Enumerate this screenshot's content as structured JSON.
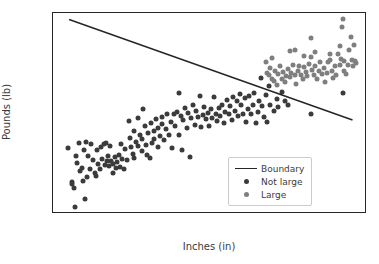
{
  "chart_data": {
    "type": "scatter",
    "title": "",
    "xlabel": "Inches (in)",
    "ylabel": "Pounds (lb)",
    "xlim": [
      59.0,
      78.5
    ],
    "ylim": [
      85,
      209
    ],
    "xticks": [
      "60.0",
      "62.5",
      "65.0",
      "67.5",
      "70.0",
      "72.5",
      "75.0",
      "77.5"
    ],
    "xtick_values": [
      60.0,
      62.5,
      65.0,
      67.5,
      70.0,
      72.5,
      75.0,
      77.5
    ],
    "yticks": [
      "100",
      "120",
      "140",
      "160",
      "180",
      "200"
    ],
    "ytick_values": [
      100,
      120,
      140,
      160,
      180,
      200
    ],
    "grid": false,
    "legend_position": "lower right",
    "legend": [
      {
        "label": "Boundary",
        "marker": "line",
        "color": "#262626"
      },
      {
        "label": "Not large",
        "marker": "dot",
        "color": "#3b3b3b"
      },
      {
        "label": "Large",
        "marker": "dot",
        "color": "#7f7f7f"
      }
    ],
    "annotations": [
      {
        "name": "boundary-line",
        "type": "line",
        "x": [
          60.0,
          77.6
        ],
        "y": [
          205.0,
          143.0
        ],
        "color": "#262626"
      }
    ],
    "series": [
      {
        "name": "Not large",
        "color": "#3b3b3b",
        "points": [
          [
            59.95,
            126.0
          ],
          [
            60.15,
            105.0
          ],
          [
            60.2,
            103.5
          ],
          [
            60.3,
            101.0
          ],
          [
            60.35,
            89.5
          ],
          [
            60.4,
            120.5
          ],
          [
            60.5,
            116.5
          ],
          [
            60.6,
            129.0
          ],
          [
            60.7,
            111.5
          ],
          [
            60.8,
            113.5
          ],
          [
            60.85,
            105.5
          ],
          [
            60.9,
            124.5
          ],
          [
            61.0,
            94.0
          ],
          [
            61.05,
            129.5
          ],
          [
            61.1,
            108.0
          ],
          [
            61.2,
            121.0
          ],
          [
            61.3,
            113.0
          ],
          [
            61.35,
            128.0
          ],
          [
            61.5,
            118.5
          ],
          [
            61.6,
            110.5
          ],
          [
            61.7,
            108.5
          ],
          [
            61.75,
            124.5
          ],
          [
            61.8,
            116.0
          ],
          [
            61.9,
            113.0
          ],
          [
            62.0,
            126.5
          ],
          [
            62.05,
            119.0
          ],
          [
            62.15,
            128.0
          ],
          [
            62.2,
            115.5
          ],
          [
            62.3,
            128.5
          ],
          [
            62.35,
            117.5
          ],
          [
            62.4,
            121.0
          ],
          [
            62.5,
            114.5
          ],
          [
            62.55,
            127.0
          ],
          [
            62.6,
            118.0
          ],
          [
            62.7,
            110.5
          ],
          [
            62.75,
            116.0
          ],
          [
            62.85,
            120.0
          ],
          [
            62.9,
            113.5
          ],
          [
            63.0,
            117.0
          ],
          [
            63.1,
            121.5
          ],
          [
            63.15,
            114.0
          ],
          [
            63.25,
            128.0
          ],
          [
            63.3,
            119.0
          ],
          [
            63.4,
            112.5
          ],
          [
            63.5,
            125.0
          ],
          [
            63.6,
            118.5
          ],
          [
            63.7,
            142.5
          ],
          [
            63.8,
            132.0
          ],
          [
            63.85,
            126.5
          ],
          [
            63.95,
            122.0
          ],
          [
            64.0,
            136.0
          ],
          [
            64.05,
            119.5
          ],
          [
            64.15,
            129.5
          ],
          [
            64.25,
            144.5
          ],
          [
            64.3,
            127.0
          ],
          [
            64.4,
            133.5
          ],
          [
            64.5,
            124.0
          ],
          [
            64.55,
            131.0
          ],
          [
            64.6,
            149.5
          ],
          [
            64.7,
            139.0
          ],
          [
            64.75,
            127.5
          ],
          [
            64.85,
            121.5
          ],
          [
            64.9,
            135.0
          ],
          [
            65.0,
            119.5
          ],
          [
            65.1,
            141.0
          ],
          [
            65.15,
            128.5
          ],
          [
            65.25,
            136.5
          ],
          [
            65.3,
            131.0
          ],
          [
            65.4,
            143.5
          ],
          [
            65.5,
            126.5
          ],
          [
            65.55,
            138.0
          ],
          [
            65.65,
            133.0
          ],
          [
            65.75,
            145.0
          ],
          [
            65.8,
            140.5
          ],
          [
            65.9,
            130.5
          ],
          [
            66.0,
            137.5
          ],
          [
            66.1,
            147.0
          ],
          [
            66.2,
            134.0
          ],
          [
            66.3,
            142.0
          ],
          [
            66.4,
            126.0
          ],
          [
            66.5,
            146.5
          ],
          [
            66.6,
            139.5
          ],
          [
            66.7,
            148.0
          ],
          [
            66.8,
            159.5
          ],
          [
            66.85,
            134.0
          ],
          [
            66.95,
            145.5
          ],
          [
            67.0,
            124.5
          ],
          [
            67.1,
            143.0
          ],
          [
            67.2,
            150.5
          ],
          [
            67.3,
            138.0
          ],
          [
            67.4,
            147.5
          ],
          [
            67.5,
            120.0
          ],
          [
            67.6,
            144.0
          ],
          [
            67.7,
            152.0
          ],
          [
            67.8,
            140.0
          ],
          [
            67.9,
            148.5
          ],
          [
            68.0,
            145.0
          ],
          [
            68.1,
            157.5
          ],
          [
            68.2,
            138.5
          ],
          [
            68.3,
            146.0
          ],
          [
            68.4,
            151.0
          ],
          [
            68.5,
            143.5
          ],
          [
            68.6,
            147.5
          ],
          [
            68.7,
            139.0
          ],
          [
            68.8,
            149.5
          ],
          [
            68.9,
            144.0
          ],
          [
            69.0,
            157.0
          ],
          [
            69.1,
            147.0
          ],
          [
            69.2,
            142.5
          ],
          [
            69.3,
            150.5
          ],
          [
            69.4,
            145.5
          ],
          [
            69.5,
            152.0
          ],
          [
            69.6,
            141.0
          ],
          [
            69.7,
            148.0
          ],
          [
            69.8,
            155.5
          ],
          [
            69.9,
            146.5
          ],
          [
            70.0,
            151.5
          ],
          [
            70.1,
            143.0
          ],
          [
            70.2,
            157.0
          ],
          [
            70.3,
            148.5
          ],
          [
            70.4,
            155.0
          ],
          [
            70.5,
            145.5
          ],
          [
            70.6,
            159.0
          ],
          [
            70.7,
            152.5
          ],
          [
            70.8,
            147.0
          ],
          [
            70.9,
            156.5
          ],
          [
            71.0,
            142.0
          ],
          [
            71.1,
            150.0
          ],
          [
            71.2,
            157.5
          ],
          [
            71.3,
            146.5
          ],
          [
            71.4,
            152.5
          ],
          [
            71.5,
            159.5
          ],
          [
            71.6,
            141.0
          ],
          [
            71.7,
            148.0
          ],
          [
            71.8,
            155.0
          ],
          [
            71.9,
            169.0
          ],
          [
            72.0,
            151.5
          ],
          [
            72.1,
            145.0
          ],
          [
            72.2,
            158.5
          ],
          [
            72.3,
            142.0
          ],
          [
            72.4,
            164.0
          ],
          [
            72.5,
            152.0
          ],
          [
            72.7,
            148.5
          ],
          [
            72.9,
            156.0
          ],
          [
            73.0,
            151.0
          ],
          [
            73.2,
            160.5
          ],
          [
            73.4,
            154.5
          ],
          [
            73.6,
            152.0
          ],
          [
            75.0,
            147.0
          ],
          [
            77.0,
            159.5
          ]
        ]
      },
      {
        "name": "Large",
        "color": "#7f7f7f",
        "points": [
          [
            72.2,
            178.5
          ],
          [
            72.3,
            172.0
          ],
          [
            72.4,
            170.5
          ],
          [
            72.5,
            175.0
          ],
          [
            72.6,
            168.5
          ],
          [
            72.7,
            167.0
          ],
          [
            72.8,
            173.5
          ],
          [
            72.9,
            164.5
          ],
          [
            73.0,
            171.5
          ],
          [
            73.1,
            176.0
          ],
          [
            73.2,
            168.0
          ],
          [
            73.3,
            172.5
          ],
          [
            73.4,
            166.5
          ],
          [
            73.5,
            170.0
          ],
          [
            73.6,
            174.5
          ],
          [
            73.7,
            169.5
          ],
          [
            73.8,
            172.0
          ],
          [
            73.9,
            177.0
          ],
          [
            74.0,
            170.5
          ],
          [
            74.1,
            165.5
          ],
          [
            74.2,
            173.0
          ],
          [
            74.3,
            176.5
          ],
          [
            74.4,
            171.0
          ],
          [
            74.5,
            168.0
          ],
          [
            74.6,
            175.5
          ],
          [
            74.7,
            172.5
          ],
          [
            74.8,
            170.0
          ],
          [
            74.9,
            177.5
          ],
          [
            75.0,
            193.5
          ],
          [
            75.0,
            182.0
          ],
          [
            75.1,
            174.0
          ],
          [
            75.2,
            171.0
          ],
          [
            75.3,
            176.0
          ],
          [
            75.4,
            168.5
          ],
          [
            75.5,
            173.5
          ],
          [
            75.6,
            179.0
          ],
          [
            75.7,
            171.5
          ],
          [
            75.8,
            175.0
          ],
          [
            75.9,
            166.5
          ],
          [
            76.0,
            172.0
          ],
          [
            76.1,
            178.5
          ],
          [
            76.2,
            180.0
          ],
          [
            76.3,
            173.0
          ],
          [
            76.4,
            169.0
          ],
          [
            76.5,
            176.5
          ],
          [
            76.6,
            171.0
          ],
          [
            76.7,
            183.5
          ],
          [
            76.8,
            177.0
          ],
          [
            76.85,
            188.5
          ],
          [
            76.9,
            180.5
          ],
          [
            76.95,
            200.5
          ],
          [
            77.0,
            205.0
          ],
          [
            77.05,
            173.0
          ],
          [
            77.1,
            179.5
          ],
          [
            77.2,
            171.5
          ],
          [
            77.3,
            177.0
          ],
          [
            77.4,
            186.0
          ],
          [
            77.5,
            194.5
          ],
          [
            77.55,
            180.0
          ],
          [
            77.6,
            176.5
          ],
          [
            77.7,
            189.0
          ],
          [
            77.75,
            179.5
          ],
          [
            77.8,
            178.0
          ],
          [
            74.0,
            186.0
          ],
          [
            73.7,
            185.5
          ],
          [
            75.3,
            185.0
          ],
          [
            76.2,
            184.0
          ],
          [
            74.6,
            182.5
          ],
          [
            72.6,
            181.0
          ]
        ]
      }
    ]
  }
}
